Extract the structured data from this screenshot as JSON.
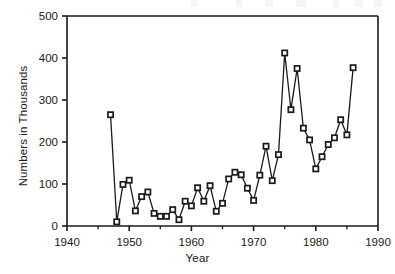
{
  "chart_data": {
    "type": "line",
    "title": "",
    "xlabel": "Year",
    "ylabel": "Numbers in Thousands",
    "xlim": [
      1940,
      1990
    ],
    "ylim": [
      0,
      500
    ],
    "xticks": [
      1940,
      1950,
      1960,
      1970,
      1980,
      1990
    ],
    "xtick_labels": [
      "1940",
      "1950",
      "1960",
      "1970",
      "1980",
      "1990"
    ],
    "yticks": [
      0,
      100,
      200,
      300,
      400,
      500
    ],
    "ytick_labels": [
      "0",
      "100",
      "200",
      "300",
      "400",
      "500"
    ],
    "minor_xticks": [
      1945,
      1955,
      1965,
      1975,
      1985
    ],
    "grid": false,
    "legend": null,
    "marker": "open-square",
    "line_color": "#1a1a1a",
    "marker_face_color": "#ffffff",
    "marker_edge_color": "#1a1a1a",
    "x": [
      1947,
      1948,
      1949,
      1950,
      1951,
      1952,
      1953,
      1954,
      1955,
      1956,
      1957,
      1958,
      1959,
      1960,
      1961,
      1962,
      1963,
      1964,
      1965,
      1966,
      1967,
      1968,
      1969,
      1970,
      1971,
      1972,
      1973,
      1974,
      1975,
      1976,
      1977,
      1978,
      1979,
      1980,
      1981,
      1982,
      1983,
      1984,
      1985,
      1986
    ],
    "values": [
      265,
      10,
      99,
      109,
      36,
      70,
      81,
      30,
      23,
      23,
      39,
      15,
      59,
      48,
      91,
      59,
      96,
      35,
      54,
      112,
      128,
      122,
      90,
      61,
      121,
      190,
      108,
      170,
      412,
      277,
      375,
      233,
      205,
      136,
      165,
      194,
      210,
      253,
      217,
      377
    ],
    "series": [
      {
        "name": "Numbers in Thousands",
        "x": [
          1947,
          1948,
          1949,
          1950,
          1951,
          1952,
          1953,
          1954,
          1955,
          1956,
          1957,
          1958,
          1959,
          1960,
          1961,
          1962,
          1963,
          1964,
          1965,
          1966,
          1967,
          1968,
          1969,
          1970,
          1971,
          1972,
          1973,
          1974,
          1975,
          1976,
          1977,
          1978,
          1979,
          1980,
          1981,
          1982,
          1983,
          1984,
          1985,
          1986
        ],
        "values": [
          265,
          10,
          99,
          109,
          36,
          70,
          81,
          30,
          23,
          23,
          39,
          15,
          59,
          48,
          91,
          59,
          96,
          35,
          54,
          112,
          128,
          122,
          90,
          61,
          121,
          190,
          108,
          170,
          412,
          277,
          375,
          233,
          205,
          136,
          165,
          194,
          210,
          253,
          217,
          377
        ]
      }
    ]
  },
  "axes": {
    "x_axis_title": "Year",
    "y_axis_title": "Numbers in Thousands"
  }
}
